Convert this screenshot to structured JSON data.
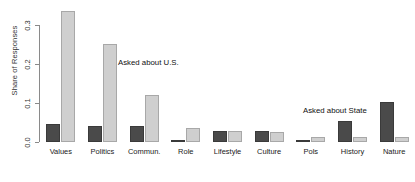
{
  "chart_data": {
    "type": "bar",
    "title": "",
    "subtitle": "",
    "xlabel": "",
    "ylabel": "Share of Responses",
    "ylim": [
      0.0,
      0.355
    ],
    "yticks": [
      0.0,
      0.1,
      0.2,
      0.3
    ],
    "ytick_labels": [
      "0.0",
      "0.1",
      "0.2",
      "0.3"
    ],
    "grid": false,
    "legend_position": "inline-annotation",
    "categories": [
      "Values",
      "Politics",
      "Commun.",
      "Role",
      "Lifestyle",
      "Culture",
      "Pols",
      "History",
      "Nature"
    ],
    "series": [
      {
        "name": "Asked about State",
        "color": "#4a4a4a",
        "values": [
          0.047,
          0.043,
          0.043,
          0.002,
          0.03,
          0.03,
          0.004,
          0.055,
          0.105
        ]
      },
      {
        "name": "Asked about U.S.",
        "color": "#cfcfcf",
        "values": [
          0.345,
          0.258,
          0.123,
          0.036,
          0.03,
          0.026,
          0.012,
          0.012,
          0.012
        ]
      }
    ],
    "annotations": [
      {
        "text": "Asked about U.S.",
        "x_px": 118,
        "y_px": 58
      },
      {
        "text": "Asked about State",
        "x_px": 303,
        "y_px": 106
      }
    ]
  }
}
